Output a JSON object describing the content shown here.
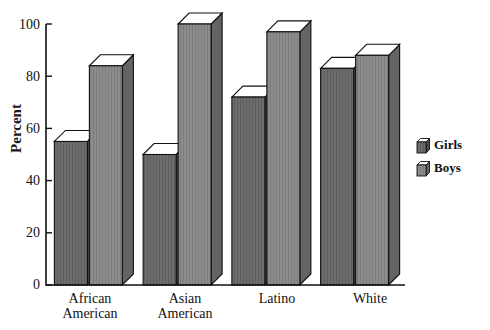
{
  "chart_data": {
    "type": "bar",
    "title": "",
    "xlabel": "",
    "ylabel": "Percent",
    "ylim": [
      0,
      100
    ],
    "yticks": [
      0,
      20,
      40,
      60,
      80,
      100
    ],
    "grid": false,
    "legend_position": "right",
    "style": "3d-extruded-bars",
    "categories": [
      "African\nAmerican",
      "Asian\nAmerican",
      "Latino",
      "White"
    ],
    "series": [
      {
        "name": "Girls",
        "values": [
          55,
          50,
          72,
          83
        ],
        "face_color": "#6d6d6d",
        "side_color": "#4a4a4a",
        "top_color": "#ffffff"
      },
      {
        "name": "Boys",
        "values": [
          84,
          100,
          97,
          88
        ],
        "face_color": "#8c8c8c",
        "side_color": "#646464",
        "top_color": "#ffffff"
      }
    ]
  },
  "legend": {
    "items": [
      {
        "label": "Girls",
        "swatch": "girls-swatch"
      },
      {
        "label": "Boys",
        "swatch": "boys-swatch"
      }
    ]
  },
  "axis": {
    "y_title": "Percent",
    "tick_labels": [
      "100",
      "80",
      "60",
      "40",
      "20",
      "0"
    ]
  },
  "colors": {
    "axis": "#111111",
    "outline": "#111111",
    "background": "#ffffff",
    "girls_face": "#6d6d6d",
    "girls_side": "#4a4a4a",
    "boys_face": "#8c8c8c",
    "boys_side": "#646464",
    "bar_top": "#ffffff"
  }
}
